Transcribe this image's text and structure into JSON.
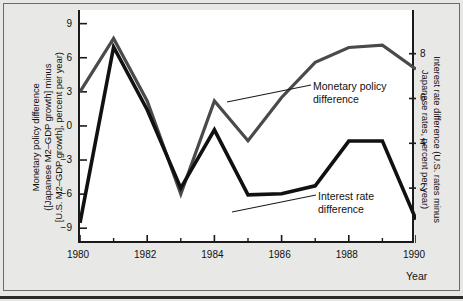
{
  "chart_data": {
    "type": "line",
    "title": "",
    "subtitle": "",
    "xlabel": "Year",
    "x": [
      1980,
      1981,
      1982,
      1983,
      1984,
      1985,
      1986,
      1987,
      1988,
      1989,
      1990
    ],
    "xlim": [
      1980,
      1990
    ],
    "xticks": [
      1980,
      1982,
      1984,
      1986,
      1988,
      1990
    ],
    "xtick_labels": [
      "1980",
      "1982",
      "1984",
      "1986",
      "1988",
      "1990"
    ],
    "xminor_ticks": [
      1981,
      1983,
      1985,
      1987,
      1989
    ],
    "grid": false,
    "legend_position": "inline-annotations",
    "left_axis": {
      "label": "Monetary policy difference ([Japanese M2–GDP growth] minus [U.S. M2–GDP growth], percent per year)",
      "label_line1": "Monetary policy difference",
      "label_line2": "([Japanese M2–GDP growth] minus",
      "label_line3": "[U.S. M2–GDP growth], percent per year)",
      "ticks": [
        9,
        6,
        3,
        0,
        -3,
        -6,
        -9
      ],
      "tick_labels": [
        "9",
        "6",
        "3",
        "0",
        "−3",
        "−6",
        "−9"
      ],
      "ylim": [
        -10.3,
        10.2
      ]
    },
    "right_axis": {
      "label": "Interest rate difference (U.S. rates minus Japanese rates, percent per year)",
      "label_line1": "Interest rate difference (U.S. rates minus",
      "label_line2": "Japanese rates, percent per year)",
      "ticks": [
        8,
        6,
        4,
        2
      ],
      "tick_labels": [
        "8",
        "6",
        "4",
        "2"
      ],
      "ylim": [
        -0.45,
        9.95
      ]
    },
    "series": [
      {
        "name": "Monetary policy difference",
        "axis": "left",
        "color": "#4a4a4a",
        "linewidth": 3.2,
        "annotation": "Monetary policy\ndifference",
        "annotation_line1": "Monetary policy",
        "annotation_line2": "difference",
        "values": [
          3.0,
          7.7,
          2.2,
          -6.0,
          2.2,
          -1.3,
          2.5,
          5.6,
          6.9,
          7.1,
          5.0
        ]
      },
      {
        "name": "Interest rate difference",
        "axis": "right",
        "color": "#111111",
        "linewidth": 3.6,
        "annotation": "Interest rate\ndifference",
        "annotation_line1": "Interest rate",
        "annotation_line2": "difference",
        "values": [
          0.45,
          8.3,
          5.5,
          2.0,
          4.6,
          1.7,
          1.75,
          2.1,
          4.1,
          4.1,
          0.6
        ]
      }
    ]
  },
  "axis_titles": {
    "x": "Year"
  }
}
